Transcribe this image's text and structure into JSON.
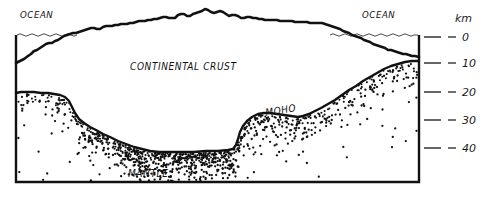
{
  "figure": {
    "style": "hand-drawn pen-and-ink geological cross section",
    "background_color": "#ffffff",
    "ink_color": "#111111"
  },
  "labels": {
    "ocean_left": "OCEAN",
    "ocean_right": "OCEAN",
    "continental_crust": "CONTINENTAL CRUST",
    "moho": "MOHO",
    "mantle": "MANTLE"
  },
  "axis": {
    "unit": "km",
    "ticks": [
      {
        "value": "0",
        "depth_km": 0,
        "y": 37
      },
      {
        "value": "10",
        "depth_km": 10,
        "y": 63
      },
      {
        "value": "20",
        "depth_km": 20,
        "y": 92
      },
      {
        "value": "30",
        "depth_km": 30,
        "y": 120
      },
      {
        "value": "40",
        "depth_km": 40,
        "y": 148
      }
    ]
  },
  "chart_data": {
    "type": "area",
    "xlabel": "",
    "ylabel": "km",
    "ylim": [
      0,
      50
    ],
    "grid": false,
    "legend_position": "none",
    "series": [
      {
        "name": "Topography / sea floor (surface)",
        "description": "Land surface rising from ocean on the left to mountain peaks at centre, then falling back to ocean on the right",
        "points": [
          [
            16,
            63
          ],
          [
            22,
            60
          ],
          [
            30,
            55
          ],
          [
            38,
            50
          ],
          [
            46,
            44
          ],
          [
            54,
            42
          ],
          [
            62,
            38
          ],
          [
            70,
            34
          ],
          [
            78,
            32
          ],
          [
            86,
            30
          ],
          [
            94,
            28
          ],
          [
            102,
            29
          ],
          [
            110,
            26
          ],
          [
            118,
            25
          ],
          [
            126,
            24
          ],
          [
            134,
            23
          ],
          [
            142,
            21
          ],
          [
            150,
            20
          ],
          [
            158,
            19
          ],
          [
            166,
            17
          ],
          [
            174,
            18
          ],
          [
            182,
            14
          ],
          [
            190,
            16
          ],
          [
            198,
            12
          ],
          [
            206,
            9
          ],
          [
            214,
            13
          ],
          [
            222,
            11
          ],
          [
            230,
            16
          ],
          [
            238,
            15
          ],
          [
            246,
            18
          ],
          [
            254,
            17
          ],
          [
            262,
            19
          ],
          [
            270,
            20
          ],
          [
            278,
            20
          ],
          [
            286,
            21
          ],
          [
            294,
            21
          ],
          [
            302,
            22
          ],
          [
            310,
            22
          ],
          [
            318,
            23
          ],
          [
            326,
            23
          ],
          [
            334,
            26
          ],
          [
            342,
            29
          ],
          [
            350,
            33
          ],
          [
            358,
            36
          ],
          [
            366,
            40
          ],
          [
            374,
            44
          ],
          [
            382,
            47
          ],
          [
            390,
            50
          ],
          [
            398,
            52
          ],
          [
            406,
            54
          ],
          [
            414,
            56
          ],
          [
            419,
            57
          ]
        ]
      },
      {
        "name": "Moho (crust-mantle boundary)",
        "description": "Deep crustal root beneath the mountains, shallow beneath the oceans",
        "points": [
          [
            16,
            93
          ],
          [
            26,
            92
          ],
          [
            40,
            93
          ],
          [
            52,
            94
          ],
          [
            62,
            96
          ],
          [
            70,
            102
          ],
          [
            74,
            112
          ],
          [
            80,
            120
          ],
          [
            90,
            127
          ],
          [
            102,
            133
          ],
          [
            114,
            139
          ],
          [
            128,
            145
          ],
          [
            142,
            149
          ],
          [
            156,
            151
          ],
          [
            172,
            152
          ],
          [
            190,
            152
          ],
          [
            210,
            151
          ],
          [
            228,
            150
          ],
          [
            236,
            147
          ],
          [
            240,
            136
          ],
          [
            244,
            126
          ],
          [
            250,
            118
          ],
          [
            258,
            114
          ],
          [
            268,
            113
          ],
          [
            280,
            114
          ],
          [
            292,
            116
          ],
          [
            300,
            117
          ],
          [
            312,
            113
          ],
          [
            324,
            107
          ],
          [
            336,
            99
          ],
          [
            348,
            90
          ],
          [
            360,
            82
          ],
          [
            372,
            75
          ],
          [
            384,
            69
          ],
          [
            396,
            65
          ],
          [
            408,
            62
          ],
          [
            419,
            61
          ]
        ]
      }
    ],
    "annotations": [
      {
        "text": "OCEAN",
        "x": 20,
        "y": 18
      },
      {
        "text": "OCEAN",
        "x": 362,
        "y": 18
      },
      {
        "text": "CONTINENTAL CRUST",
        "x": 130,
        "y": 70
      },
      {
        "text": "MOHO",
        "x": 268,
        "y": 115
      },
      {
        "text": "MANTLE",
        "x": 128,
        "y": 176
      }
    ],
    "regions": [
      {
        "name": "ocean",
        "fill": "white",
        "note": "thin wedge above sea level line at left and right edges"
      },
      {
        "name": "continental crust",
        "fill": "white",
        "note": "between surface profile and Moho"
      },
      {
        "name": "mantle",
        "fill": "white with stipple",
        "note": "below Moho, stipple density decreases with depth"
      }
    ]
  },
  "geometry": {
    "frame": {
      "left": 16,
      "right": 419,
      "top": 35,
      "bottom": 182
    },
    "sea_level_y": 35,
    "axis_tick_x1": 424,
    "axis_tick_x2": 441,
    "axis_dash_x1": 448,
    "axis_dash_x2": 456,
    "axis_label_x": 462,
    "axis_unit_pos": {
      "x": 457,
      "y": 22
    }
  }
}
